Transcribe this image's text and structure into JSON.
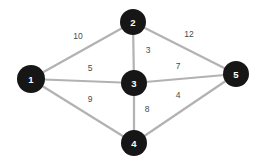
{
  "diagram": {
    "type": "node-link-graph",
    "background_color": "#ffffff",
    "node_color": "#161616",
    "node_label_color": "#ffffff",
    "edge_color": "#b2b2b2",
    "weight_label_color": "#4a4a4a",
    "nodes": [
      {
        "id": "1",
        "label": "1",
        "x": 31,
        "y": 79,
        "r": 14
      },
      {
        "id": "2",
        "label": "2",
        "x": 133,
        "y": 22,
        "r": 13
      },
      {
        "id": "3",
        "label": "3",
        "x": 134,
        "y": 83,
        "r": 13
      },
      {
        "id": "4",
        "label": "4",
        "x": 134,
        "y": 143,
        "r": 13
      },
      {
        "id": "5",
        "label": "5",
        "x": 236,
        "y": 74,
        "r": 13
      }
    ],
    "edges": [
      {
        "from": "1",
        "to": "2",
        "weight": "10",
        "x1": 31,
        "y1": 79,
        "x2": 133,
        "y2": 22,
        "lx": 78,
        "ly": 36
      },
      {
        "from": "1",
        "to": "3",
        "weight": "5",
        "x1": 31,
        "y1": 79,
        "x2": 134,
        "y2": 83,
        "lx": 90,
        "ly": 68
      },
      {
        "from": "1",
        "to": "4",
        "weight": "9",
        "x1": 31,
        "y1": 79,
        "x2": 134,
        "y2": 143,
        "lx": 90,
        "ly": 99
      },
      {
        "from": "2",
        "to": "3",
        "weight": "3",
        "x1": 133,
        "y1": 22,
        "x2": 134,
        "y2": 83,
        "lx": 148,
        "ly": 50
      },
      {
        "from": "2",
        "to": "5",
        "weight": "12",
        "x1": 133,
        "y1": 22,
        "x2": 236,
        "y2": 74,
        "lx": 189,
        "ly": 34
      },
      {
        "from": "3",
        "to": "5",
        "weight": "7",
        "x1": 134,
        "y1": 83,
        "x2": 236,
        "y2": 74,
        "lx": 178,
        "ly": 66
      },
      {
        "from": "3",
        "to": "4",
        "weight": "8",
        "x1": 134,
        "y1": 83,
        "x2": 134,
        "y2": 143,
        "lx": 147,
        "ly": 109
      },
      {
        "from": "4",
        "to": "5",
        "weight": "4",
        "x1": 134,
        "y1": 143,
        "x2": 236,
        "y2": 74,
        "lx": 178,
        "ly": 95
      }
    ]
  }
}
